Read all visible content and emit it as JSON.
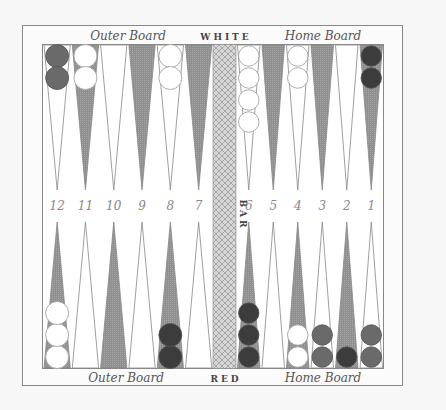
{
  "board": {
    "top_left_label": "Outer Board",
    "top_center_label": "WHITE",
    "top_right_label": "Home Board",
    "bottom_left_label": "Outer Board",
    "bottom_center_label": "RED",
    "bottom_right_label": "Home Board",
    "bar_label": "BAR",
    "colors": {
      "background": "#f7f7f7",
      "frame": "#777777",
      "dark_point": "#8f8f8f",
      "light_point": "#ffffff",
      "white_checker": "#ffffff",
      "red_checker_dark": "#3c3c3c",
      "red_checker_mid": "#6a6a6a",
      "bar": "#cfcfcf"
    }
  },
  "top_points": [
    {
      "number": "12",
      "shade": "light",
      "checkers": [
        {
          "color": "red",
          "shade": "mid"
        },
        {
          "color": "red",
          "shade": "mid"
        }
      ]
    },
    {
      "number": "11",
      "shade": "dark",
      "checkers": [
        {
          "color": "white"
        },
        {
          "color": "white"
        }
      ]
    },
    {
      "number": "10",
      "shade": "light",
      "checkers": []
    },
    {
      "number": "9",
      "shade": "dark",
      "checkers": []
    },
    {
      "number": "8",
      "shade": "light",
      "checkers": [
        {
          "color": "white"
        },
        {
          "color": "white"
        }
      ]
    },
    {
      "number": "7",
      "shade": "dark",
      "checkers": []
    },
    {
      "number": "6",
      "shade": "light",
      "checkers": [
        {
          "color": "white"
        },
        {
          "color": "white"
        },
        {
          "color": "white"
        },
        {
          "color": "white"
        }
      ]
    },
    {
      "number": "5",
      "shade": "dark",
      "checkers": []
    },
    {
      "number": "4",
      "shade": "light",
      "checkers": [
        {
          "color": "white"
        },
        {
          "color": "white"
        }
      ]
    },
    {
      "number": "3",
      "shade": "dark",
      "checkers": []
    },
    {
      "number": "2",
      "shade": "light",
      "checkers": []
    },
    {
      "number": "1",
      "shade": "dark",
      "checkers": [
        {
          "color": "red",
          "shade": "dark"
        },
        {
          "color": "red",
          "shade": "dark"
        }
      ]
    }
  ],
  "bottom_points": [
    {
      "number": "12",
      "shade": "dark",
      "checkers": [
        {
          "color": "white"
        },
        {
          "color": "white"
        },
        {
          "color": "white"
        }
      ]
    },
    {
      "number": "11",
      "shade": "light",
      "checkers": []
    },
    {
      "number": "10",
      "shade": "dark",
      "checkers": []
    },
    {
      "number": "9",
      "shade": "light",
      "checkers": []
    },
    {
      "number": "8",
      "shade": "dark",
      "checkers": [
        {
          "color": "red",
          "shade": "dark"
        },
        {
          "color": "red",
          "shade": "dark"
        }
      ]
    },
    {
      "number": "7",
      "shade": "light",
      "checkers": []
    },
    {
      "number": "6",
      "shade": "dark",
      "checkers": [
        {
          "color": "red",
          "shade": "dark"
        },
        {
          "color": "red",
          "shade": "dark"
        },
        {
          "color": "red",
          "shade": "dark"
        }
      ]
    },
    {
      "number": "5",
      "shade": "light",
      "checkers": []
    },
    {
      "number": "4",
      "shade": "dark",
      "checkers": [
        {
          "color": "white"
        },
        {
          "color": "white"
        }
      ]
    },
    {
      "number": "3",
      "shade": "light",
      "checkers": [
        {
          "color": "red",
          "shade": "mid"
        },
        {
          "color": "red",
          "shade": "mid"
        }
      ]
    },
    {
      "number": "2",
      "shade": "dark",
      "checkers": [
        {
          "color": "red",
          "shade": "dark"
        }
      ]
    },
    {
      "number": "1",
      "shade": "light",
      "checkers": [
        {
          "color": "red",
          "shade": "mid"
        },
        {
          "color": "red",
          "shade": "mid"
        }
      ]
    }
  ],
  "point_numbers": [
    "12",
    "11",
    "10",
    "9",
    "8",
    "7",
    "6",
    "5",
    "4",
    "3",
    "2",
    "1"
  ]
}
